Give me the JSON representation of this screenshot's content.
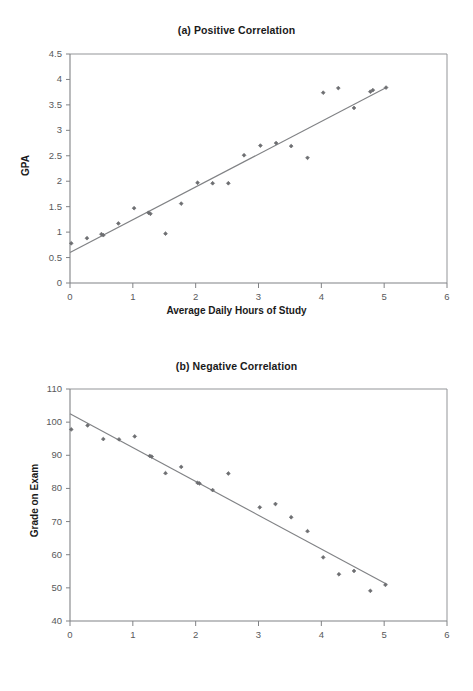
{
  "figure": {
    "width": 473,
    "height": 691,
    "background": "#ffffff",
    "ink_color": "#231f20",
    "marker_color": "#6d6e71",
    "line_color": "#808285",
    "axis_color": "#939598"
  },
  "charts": [
    {
      "id": "a",
      "title": "(a) Positive Correlation",
      "xlabel": "Average Daily Hours of Study",
      "ylabel": "GPA",
      "xticks": [
        "0",
        "1",
        "2",
        "3",
        "4",
        "5",
        "6"
      ],
      "yticks": [
        "0",
        "0.5",
        "1",
        "1.5",
        "2",
        "2.5",
        "3",
        "3.5",
        "4",
        "4.5"
      ]
    },
    {
      "id": "b",
      "title": "(b) Negative Correlation",
      "xlabel": "Number of Beers Consumed",
      "ylabel": "Grade on Exam",
      "xticks": [
        "0",
        "1",
        "2",
        "3",
        "4",
        "5",
        "6"
      ],
      "yticks": [
        "40",
        "50",
        "60",
        "70",
        "80",
        "90",
        "100",
        "110"
      ]
    }
  ],
  "chart_data": [
    {
      "type": "scatter",
      "title": "(a) Positive Correlation",
      "xlabel": "Average Daily Hours of Study",
      "ylabel": "GPA",
      "xlim": [
        0,
        6
      ],
      "ylim": [
        0,
        4.5
      ],
      "xticks": [
        0,
        1,
        2,
        3,
        4,
        5,
        6
      ],
      "yticks": [
        0,
        0.5,
        1,
        1.5,
        2,
        2.5,
        3,
        3.5,
        4,
        4.5
      ],
      "grid": false,
      "legend": "none",
      "points": [
        {
          "x": 0.02,
          "y": 0.78
        },
        {
          "x": 0.27,
          "y": 0.88
        },
        {
          "x": 0.5,
          "y": 0.96
        },
        {
          "x": 0.53,
          "y": 0.94
        },
        {
          "x": 0.77,
          "y": 1.17
        },
        {
          "x": 1.02,
          "y": 1.47
        },
        {
          "x": 1.25,
          "y": 1.38
        },
        {
          "x": 1.28,
          "y": 1.36
        },
        {
          "x": 1.52,
          "y": 0.97
        },
        {
          "x": 1.77,
          "y": 1.56
        },
        {
          "x": 2.03,
          "y": 1.97
        },
        {
          "x": 2.27,
          "y": 1.96
        },
        {
          "x": 2.52,
          "y": 1.96
        },
        {
          "x": 2.77,
          "y": 2.51
        },
        {
          "x": 3.03,
          "y": 2.7
        },
        {
          "x": 3.28,
          "y": 2.75
        },
        {
          "x": 3.52,
          "y": 2.69
        },
        {
          "x": 3.78,
          "y": 2.46
        },
        {
          "x": 4.03,
          "y": 3.74
        },
        {
          "x": 4.27,
          "y": 3.83
        },
        {
          "x": 4.52,
          "y": 3.44
        },
        {
          "x": 4.78,
          "y": 3.76
        },
        {
          "x": 4.82,
          "y": 3.79
        },
        {
          "x": 5.03,
          "y": 3.84
        }
      ],
      "trendline": {
        "x0": 0.0,
        "y0": 0.6,
        "x1": 5.05,
        "y1": 3.85
      }
    },
    {
      "type": "scatter",
      "title": "(b) Negative Correlation",
      "xlabel": "Number of Beers Consumed",
      "ylabel": "Grade on Exam",
      "xlim": [
        0,
        6
      ],
      "ylim": [
        40,
        110
      ],
      "xticks": [
        0,
        1,
        2,
        3,
        4,
        5,
        6
      ],
      "yticks": [
        40,
        50,
        60,
        70,
        80,
        90,
        100,
        110
      ],
      "grid": false,
      "legend": "none",
      "points": [
        {
          "x": 0.02,
          "y": 97.8
        },
        {
          "x": 0.28,
          "y": 99.0
        },
        {
          "x": 0.53,
          "y": 94.9
        },
        {
          "x": 0.78,
          "y": 94.8
        },
        {
          "x": 1.03,
          "y": 95.7
        },
        {
          "x": 1.27,
          "y": 89.8
        },
        {
          "x": 1.3,
          "y": 89.6
        },
        {
          "x": 1.52,
          "y": 84.6
        },
        {
          "x": 1.77,
          "y": 86.5
        },
        {
          "x": 2.03,
          "y": 81.7
        },
        {
          "x": 2.06,
          "y": 81.5
        },
        {
          "x": 2.27,
          "y": 79.5
        },
        {
          "x": 2.52,
          "y": 84.5
        },
        {
          "x": 3.02,
          "y": 74.3
        },
        {
          "x": 3.27,
          "y": 75.3
        },
        {
          "x": 3.52,
          "y": 71.3
        },
        {
          "x": 3.78,
          "y": 67.1
        },
        {
          "x": 4.03,
          "y": 59.2
        },
        {
          "x": 4.28,
          "y": 54.1
        },
        {
          "x": 4.52,
          "y": 55.1
        },
        {
          "x": 4.78,
          "y": 49.1
        },
        {
          "x": 5.02,
          "y": 50.9
        }
      ],
      "trendline": {
        "x0": 0.0,
        "y0": 102.5,
        "x1": 5.05,
        "y1": 51.0
      }
    }
  ]
}
